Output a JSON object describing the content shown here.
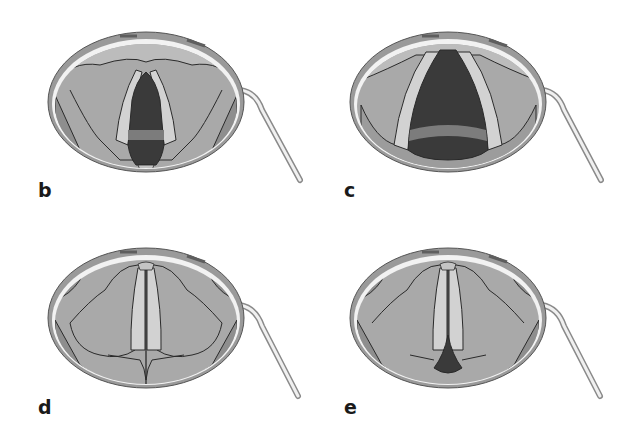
{
  "figure": {
    "colors": {
      "background": "#ffffff",
      "mirror_rim": "#9a9a9a",
      "mirror_highlight": "#f2f2f2",
      "tissue": "#a9a9a9",
      "tissue_dark": "#8e8e8e",
      "vocal_fold": "#d2d2d2",
      "airway": "#3a3a3a",
      "trachea_ring": "#7c7c7c",
      "outline": "#2a2a2a"
    },
    "panels": [
      {
        "id": "b",
        "label": "b",
        "state": "partially open glottis"
      },
      {
        "id": "c",
        "label": "c",
        "state": "wide open glottis (respiration)"
      },
      {
        "id": "d",
        "label": "d",
        "state": "closed glottis (phonation)"
      },
      {
        "id": "e",
        "label": "e",
        "state": "closed glottis with posterior gap"
      }
    ]
  }
}
